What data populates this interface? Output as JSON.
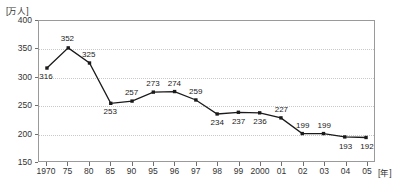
{
  "chart_data": {
    "type": "line",
    "title": "",
    "xlabel": "[年]",
    "ylabel": "[万人]",
    "ylim": [
      150,
      400
    ],
    "yticks": [
      150,
      200,
      250,
      300,
      350,
      400
    ],
    "grid": true,
    "legend": "none",
    "categories": [
      "1970",
      "75",
      "80",
      "85",
      "90",
      "95",
      "96",
      "97",
      "98",
      "99",
      "2000",
      "01",
      "02",
      "03",
      "04",
      "05"
    ],
    "values": [
      316,
      352,
      325,
      253,
      257,
      273,
      274,
      259,
      234,
      237,
      236,
      227,
      199,
      199,
      193,
      192
    ],
    "label_positions": [
      "below",
      "above",
      "above",
      "below",
      "above",
      "above",
      "above",
      "above",
      "below",
      "below",
      "below",
      "above",
      "above",
      "above",
      "below",
      "below"
    ],
    "series": [
      {
        "name": "",
        "color": "#1a1a1a",
        "marker": "square",
        "values": [
          316,
          352,
          325,
          253,
          257,
          273,
          274,
          259,
          234,
          237,
          236,
          227,
          199,
          199,
          193,
          192
        ]
      }
    ]
  },
  "axes": {
    "y_unit_label": "[万人]",
    "x_unit_label": "[年]",
    "frame_color": "#9a9a9a",
    "grid_color": "#c9c9c9",
    "tick_color": "#6f6f6f"
  }
}
